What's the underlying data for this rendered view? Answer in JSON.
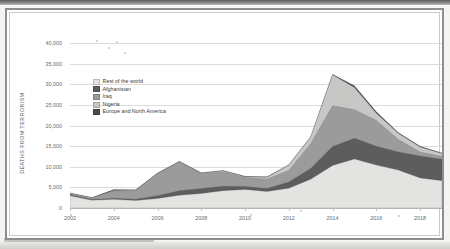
{
  "figure": {
    "frame_border_color": "#8e8e8e",
    "background": "#ffffff"
  },
  "chart_data": {
    "type": "area",
    "stacked": true,
    "title": "",
    "xlabel": "",
    "ylabel": "DEATHS FROM TERRORISM",
    "ylim": [
      0,
      40000
    ],
    "ytick_labels": [
      "0",
      "5,000",
      "10,000",
      "15,000",
      "20,000",
      "25,000",
      "30,000",
      "35,000",
      "40,000"
    ],
    "ytick_values": [
      0,
      5000,
      10000,
      15000,
      20000,
      25000,
      30000,
      35000,
      40000
    ],
    "xlim": [
      2002,
      2019
    ],
    "xtick_labels": [
      "2002",
      "2004",
      "2006",
      "2008",
      "2010",
      "2012",
      "2014",
      "2016",
      "2018"
    ],
    "xtick_values": [
      2002,
      2004,
      2006,
      2008,
      2010,
      2012,
      2014,
      2016,
      2018
    ],
    "x": [
      2002,
      2003,
      2004,
      2005,
      2006,
      2007,
      2008,
      2009,
      2010,
      2011,
      2012,
      2013,
      2014,
      2015,
      2016,
      2017,
      2018,
      2019
    ],
    "grid": true,
    "legend_position": "upper-left-inside",
    "series": [
      {
        "name": "Rest of the world",
        "color": "#e3e3e1",
        "values": [
          3000,
          1900,
          2100,
          1800,
          2300,
          3100,
          3500,
          4200,
          4500,
          4000,
          4800,
          7000,
          10300,
          11900,
          10400,
          9200,
          7300,
          6600
        ]
      },
      {
        "name": "Afghanistan",
        "color": "#5d5d5d",
        "values": [
          200,
          180,
          260,
          340,
          700,
          1100,
          1200,
          1100,
          700,
          700,
          1500,
          2600,
          4600,
          5000,
          4600,
          4400,
          5300,
          5200
        ]
      },
      {
        "name": "Iraq",
        "color": "#9b9b9b",
        "values": [
          300,
          300,
          1800,
          2100,
          5300,
          6900,
          3600,
          3500,
          2200,
          2300,
          2800,
          6000,
          9900,
          6900,
          6200,
          3000,
          1000,
          700
        ]
      },
      {
        "name": "Nigeria",
        "color": "#c7c7c5",
        "values": [
          60,
          60,
          80,
          90,
          90,
          120,
          140,
          240,
          200,
          450,
          1300,
          1600,
          7500,
          5400,
          1800,
          1500,
          1200,
          700
        ]
      },
      {
        "name": "Europe and North America",
        "color": "#4a4a4a",
        "values": [
          100,
          80,
          240,
          70,
          70,
          110,
          90,
          80,
          80,
          130,
          90,
          90,
          120,
          420,
          350,
          220,
          180,
          120
        ]
      }
    ]
  },
  "legend": {
    "items": [
      {
        "label": "Rest of the world",
        "color": "#e3e3e1"
      },
      {
        "label": "Afghanistan",
        "color": "#5d5d5d"
      },
      {
        "label": "Iraq",
        "color": "#9b9b9b"
      },
      {
        "label": "Nigeria",
        "color": "#c7c7c5"
      },
      {
        "label": "Europe and North America",
        "color": "#4a4a4a"
      }
    ]
  }
}
